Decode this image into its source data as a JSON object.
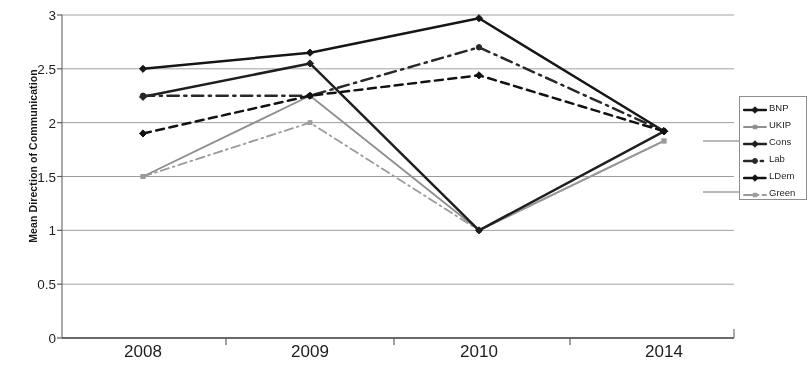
{
  "chart_data": {
    "type": "line",
    "title": "",
    "xlabel": "",
    "ylabel": "Mean Direction of Communication",
    "categories": [
      "2008",
      "2009",
      "2010",
      "2014"
    ],
    "x_tick_labels": [
      "2008",
      "2009",
      "2010",
      "2014"
    ],
    "y_tick_labels": [
      "0",
      "0.5",
      "1",
      "1.5",
      "2",
      "2.5",
      "3"
    ],
    "y_tick_values": [
      0,
      0.5,
      1,
      1.5,
      2,
      2.5,
      3
    ],
    "ylim": [
      0,
      3
    ],
    "grid": "horizontal",
    "legend_position": "right",
    "series": [
      {
        "name": "BNP",
        "values": [
          2.5,
          2.65,
          2.97,
          1.92
        ],
        "marker": "diamond",
        "line_style": "solid",
        "color": "#1a1a1a"
      },
      {
        "name": "UKIP",
        "values": [
          1.5,
          2.25,
          1.0,
          1.83
        ],
        "marker": "square",
        "line_style": "solid",
        "color": "#8e8e8e"
      },
      {
        "name": "Cons",
        "values": [
          2.24,
          2.55,
          1.0,
          1.92
        ],
        "marker": "diamond",
        "line_style": "solid",
        "color": "#232323"
      },
      {
        "name": "Lab",
        "values": [
          2.25,
          2.25,
          2.7,
          1.92
        ],
        "marker": "circle",
        "line_style": "dashdot",
        "color": "#2b2b2b"
      },
      {
        "name": "LDem",
        "values": [
          1.9,
          2.25,
          2.44,
          1.92
        ],
        "marker": "diamond",
        "line_style": "dashed",
        "color": "#161616"
      },
      {
        "name": "Green",
        "values": [
          1.5,
          2.0,
          1.0,
          1.83
        ],
        "marker": "square",
        "line_style": "dashdot",
        "color": "#9a9a9a"
      }
    ]
  },
  "legend": {
    "items": [
      {
        "label": "BNP"
      },
      {
        "label": "UKIP"
      },
      {
        "label": "Cons"
      },
      {
        "label": "Lab"
      },
      {
        "label": "LDem"
      },
      {
        "label": "Green"
      }
    ]
  }
}
